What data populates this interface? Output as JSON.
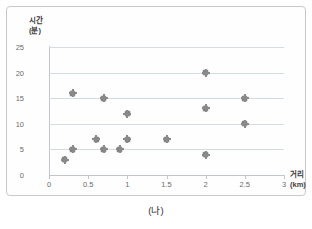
{
  "caption": "(나)",
  "chart_data": {
    "type": "scatter",
    "title": "",
    "xlabel": "거리",
    "xunit": "(km)",
    "ylabel": "시간",
    "yunit": "(분)",
    "xlim": [
      0,
      3
    ],
    "ylim": [
      0,
      25
    ],
    "xticks": [
      "0",
      "0.5",
      "1",
      "1.5",
      "2",
      "2.5",
      "3"
    ],
    "xtick_values": [
      0,
      0.5,
      1,
      1.5,
      2,
      2.5,
      3
    ],
    "yticks": [
      "0",
      "5",
      "10",
      "15",
      "20",
      "25"
    ],
    "ytick_values": [
      0,
      5,
      10,
      15,
      20,
      25
    ],
    "grid": "horizontal",
    "legend": "none",
    "marker_color": "#808080",
    "gridline_color": "#d6dce4",
    "points": [
      {
        "x": 0.2,
        "y": 3
      },
      {
        "x": 0.3,
        "y": 5
      },
      {
        "x": 0.3,
        "y": 16
      },
      {
        "x": 0.6,
        "y": 7
      },
      {
        "x": 0.7,
        "y": 5
      },
      {
        "x": 0.7,
        "y": 15
      },
      {
        "x": 0.9,
        "y": 5
      },
      {
        "x": 1.0,
        "y": 7
      },
      {
        "x": 1.0,
        "y": 12
      },
      {
        "x": 1.5,
        "y": 7
      },
      {
        "x": 2.0,
        "y": 4
      },
      {
        "x": 2.0,
        "y": 13
      },
      {
        "x": 2.0,
        "y": 20
      },
      {
        "x": 2.5,
        "y": 10
      },
      {
        "x": 2.5,
        "y": 15
      }
    ]
  }
}
